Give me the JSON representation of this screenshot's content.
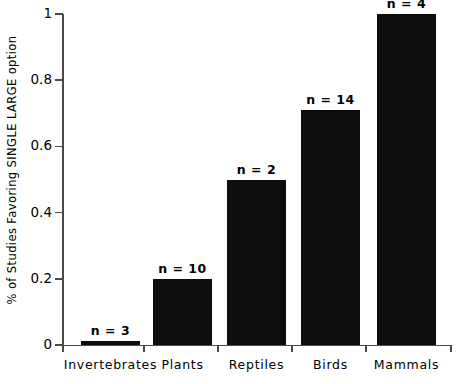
{
  "chart_data": {
    "type": "bar",
    "title": "",
    "xlabel": "",
    "ylabel": "% of Studies Favoring SINGLE LARGE option",
    "categories": [
      "Invertebrates",
      "Plants",
      "Reptiles",
      "Birds",
      "Mammals"
    ],
    "values": [
      0.01,
      0.2,
      0.5,
      0.71,
      1.0
    ],
    "annotations": [
      "n = 3",
      "n = 10",
      "n = 2",
      "n = 14",
      "n = 4"
    ],
    "ylim": [
      0,
      1
    ],
    "ytick_labels": [
      "0",
      "0.2",
      "0.4",
      "0.6",
      "0.8",
      "1"
    ],
    "ytick_values": [
      0,
      0.2,
      0.4,
      0.6,
      0.8,
      1
    ],
    "grid": false,
    "legend": "none",
    "bar_color": "#0d0d0d",
    "axis_color": "#4a4a4a",
    "background_color": "#ffffff"
  }
}
